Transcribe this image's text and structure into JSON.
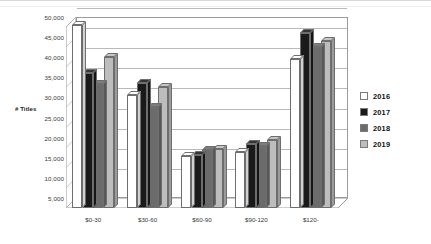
{
  "chart_data": {
    "type": "bar",
    "title": "",
    "subtitle": "",
    "xlabel": "",
    "ylabel": "# Titles",
    "categories": [
      "$0-30",
      "$30-60",
      "$60-90",
      "$90-120",
      "$120-"
    ],
    "series": [
      {
        "name": "2016",
        "color": "#ffffff",
        "values": [
          50500,
          33000,
          18000,
          19000,
          42000
        ]
      },
      {
        "name": "2017",
        "color": "#1a1a1a",
        "values": [
          38500,
          36200,
          18200,
          21000,
          48500
        ]
      },
      {
        "name": "2018",
        "color": "#6b6b6b",
        "values": [
          35900,
          30000,
          19300,
          20300,
          45000
        ]
      },
      {
        "name": "2019",
        "color": "#bdbdbd",
        "values": [
          42500,
          35000,
          19700,
          21800,
          46500
        ]
      }
    ],
    "ylim": [
      5000,
      50000
    ],
    "ytick_values": [
      5000,
      10000,
      15000,
      20000,
      25000,
      30000,
      35000,
      40000,
      45000,
      50000
    ],
    "ytick_labels": [
      "5,000",
      "10,000",
      "15,000",
      "20,000",
      "25,000",
      "30,000",
      "35,000",
      "40,000",
      "45,000",
      "50,000"
    ],
    "grid": true,
    "legend_position": "right",
    "style": "3d-clustered-column"
  },
  "axis": {
    "y_title": "# Titles"
  },
  "legend": {
    "items": [
      {
        "label": "2016",
        "color": "#ffffff"
      },
      {
        "label": "2017",
        "color": "#1a1a1a"
      },
      {
        "label": "2018",
        "color": "#6b6b6b"
      },
      {
        "label": "2019",
        "color": "#bdbdbd"
      }
    ]
  },
  "colors": {
    "axis_line": "#9a9a9a",
    "grid_line": "#b9b9b9",
    "text": "#3a3a3a",
    "background": "#ffffff"
  }
}
